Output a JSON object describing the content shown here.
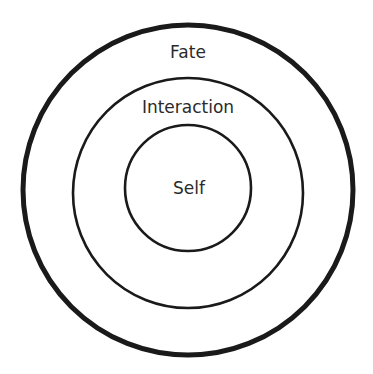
{
  "diagram": {
    "type": "concentric-circles",
    "center": {
      "x": 188,
      "y": 190
    },
    "rings": [
      {
        "id": "outer",
        "label": "Fate",
        "radius": 165,
        "stroke_width": 5,
        "label_y": 58
      },
      {
        "id": "middle",
        "label": "Interaction",
        "radius": 115,
        "stroke_width": 2.6,
        "label_y": 112
      },
      {
        "id": "inner",
        "label": "Self",
        "radius": 63,
        "stroke_width": 2.6,
        "label_y": 193
      }
    ],
    "stroke_color": "#1a1a1a",
    "text_color": "#2a2a2a",
    "background": "#ffffff"
  }
}
